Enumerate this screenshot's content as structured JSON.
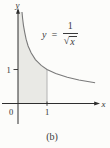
{
  "figure": {
    "caption": "(b)",
    "x_axis_label": "x",
    "y_axis_label": "y",
    "origin_label": "0",
    "x_tick_label": "1",
    "y_tick_label": "1"
  },
  "equation": {
    "lhs": "y =",
    "numerator": "1",
    "sqrt_symbol": "√",
    "radicand": "x"
  },
  "colors": {
    "background": "#fcfcfa",
    "axis": "#2e2e2e",
    "curve": "#7a7a7a",
    "shade": "#e9e9e5",
    "guide_line": "#ababab",
    "text": "#333333"
  },
  "chart_data": {
    "type": "line",
    "function": "y = 1/√x",
    "x": [
      0.138,
      0.16,
      0.19,
      0.23,
      0.28,
      0.35,
      0.45,
      0.6,
      0.8,
      1.0,
      1.3,
      1.7,
      2.1,
      2.66
    ],
    "y": [
      2.69,
      2.5,
      2.29,
      2.09,
      1.89,
      1.69,
      1.49,
      1.29,
      1.12,
      1.0,
      0.88,
      0.77,
      0.69,
      0.61
    ],
    "xlabel": "x",
    "ylabel": "y",
    "x_ticks": [
      0,
      1
    ],
    "y_ticks": [
      1
    ],
    "xlim": [
      0,
      2.8
    ],
    "ylim": [
      0,
      2.75
    ],
    "grid": false,
    "legend": "none",
    "shaded_region": {
      "from_x": 0,
      "to_x": 1,
      "description": "area under curve between x=0 and x=1"
    },
    "annotation": "y = 1/√x",
    "caption": "(b)"
  }
}
